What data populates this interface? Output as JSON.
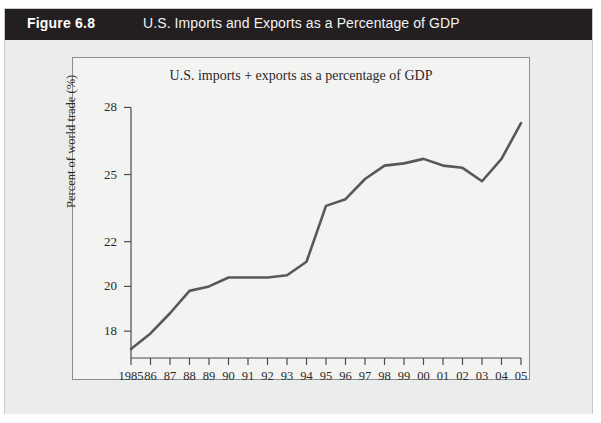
{
  "header": {
    "figure_label": "Figure 6.8",
    "figure_title": "U.S. Imports and Exports as a Percentage of GDP"
  },
  "chart_data": {
    "type": "line",
    "title": "U.S. imports + exports as a percentage of GDP",
    "xlabel": "",
    "ylabel": "Percent of world trade (%)",
    "grid": false,
    "legend": "none",
    "xlim": [
      1985,
      2005
    ],
    "ylim": [
      16.8,
      28.6
    ],
    "yticks": [
      18,
      20,
      22,
      25,
      28
    ],
    "ytick_labels": [
      "18",
      "20",
      "22",
      "25",
      "28"
    ],
    "categories": [
      "1985",
      "86",
      "87",
      "88",
      "89",
      "90",
      "91",
      "92",
      "93",
      "94",
      "95",
      "96",
      "97",
      "98",
      "99",
      "00",
      "01",
      "02",
      "03",
      "04",
      "05"
    ],
    "x": [
      1985,
      1986,
      1987,
      1988,
      1989,
      1990,
      1991,
      1992,
      1993,
      1994,
      1995,
      1996,
      1997,
      1998,
      1999,
      2000,
      2001,
      2002,
      2003,
      2004,
      2005
    ],
    "values": [
      17.2,
      17.9,
      18.8,
      19.8,
      20.0,
      20.4,
      20.4,
      20.4,
      20.5,
      21.1,
      23.6,
      23.9,
      24.8,
      25.4,
      25.5,
      25.7,
      25.4,
      25.3,
      24.7,
      25.7,
      27.3
    ],
    "series": [
      {
        "name": "U.S. imports + exports as a percentage of GDP",
        "values": [
          17.2,
          17.9,
          18.8,
          19.8,
          20.0,
          20.4,
          20.4,
          20.4,
          20.5,
          21.1,
          23.6,
          23.9,
          24.8,
          25.4,
          25.5,
          25.7,
          25.4,
          25.3,
          24.7,
          25.7,
          27.3
        ]
      }
    ],
    "line_color": "#58585a",
    "plot_background": "#f3f3f2",
    "figure_background": "#ebecec",
    "header_background": "#231f20"
  }
}
